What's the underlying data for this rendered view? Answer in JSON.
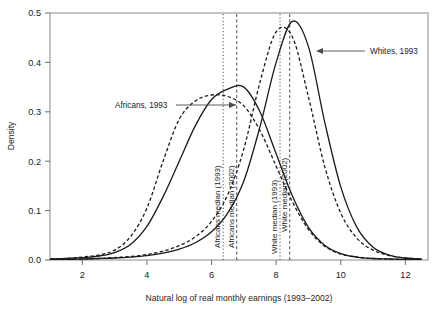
{
  "chart_data": {
    "type": "line",
    "title": "",
    "xlabel": "Natural log of real monthly earnings (1993–2002)",
    "ylabel": "Density",
    "xlim": [
      1.0,
      12.7
    ],
    "ylim": [
      0.0,
      0.5
    ],
    "xticks": [
      2,
      4,
      6,
      8,
      10,
      12
    ],
    "xticklabels": [
      "2",
      "4",
      "6",
      "8",
      "10",
      "12"
    ],
    "yticks": [
      0.0,
      0.1,
      0.2,
      0.3,
      0.4,
      0.5
    ],
    "yticklabels": [
      "0.0",
      "0.1",
      "0.2",
      "0.3",
      "0.4",
      "0.5"
    ],
    "grid": false,
    "legend_position": "none",
    "x": [
      1.0,
      1.5,
      2.0,
      2.5,
      3.0,
      3.5,
      4.0,
      4.5,
      5.0,
      5.5,
      6.0,
      6.5,
      7.0,
      7.5,
      8.0,
      8.5,
      9.0,
      9.5,
      10.0,
      10.5,
      11.0,
      11.5,
      12.0,
      12.5
    ],
    "series": [
      {
        "name": "Africans, 1993",
        "style": "solid",
        "color": "#1a1a1a",
        "values": [
          0.002,
          0.003,
          0.005,
          0.008,
          0.015,
          0.032,
          0.068,
          0.128,
          0.2,
          0.272,
          0.325,
          0.346,
          0.35,
          0.3,
          0.215,
          0.13,
          0.066,
          0.03,
          0.013,
          0.006,
          0.003,
          0.002,
          0.001,
          0.001
        ]
      },
      {
        "name": "Africans, 2002",
        "style": "dashed",
        "color": "#1a1a1a",
        "values": [
          0.002,
          0.003,
          0.006,
          0.01,
          0.02,
          0.048,
          0.105,
          0.2,
          0.285,
          0.322,
          0.334,
          0.331,
          0.312,
          0.262,
          0.19,
          0.118,
          0.062,
          0.028,
          0.012,
          0.006,
          0.003,
          0.002,
          0.001,
          0.001
        ]
      },
      {
        "name": "Whites, 1993",
        "style": "solid",
        "color": "#1a1a1a",
        "values": [
          0.001,
          0.001,
          0.002,
          0.003,
          0.004,
          0.006,
          0.009,
          0.014,
          0.022,
          0.035,
          0.057,
          0.095,
          0.16,
          0.27,
          0.4,
          0.483,
          0.432,
          0.28,
          0.148,
          0.066,
          0.026,
          0.01,
          0.004,
          0.002
        ]
      },
      {
        "name": "Whites, 2002",
        "style": "dashed",
        "color": "#1a1a1a",
        "values": [
          0.001,
          0.001,
          0.002,
          0.003,
          0.005,
          0.007,
          0.011,
          0.018,
          0.029,
          0.047,
          0.078,
          0.132,
          0.225,
          0.36,
          0.462,
          0.452,
          0.33,
          0.19,
          0.095,
          0.044,
          0.02,
          0.009,
          0.004,
          0.002
        ]
      }
    ],
    "vlines": [
      {
        "id": "africans-median-1993",
        "label": "Africans median (1993)",
        "x": 6.36,
        "style": "dotted"
      },
      {
        "id": "africans-median-2002",
        "label": "Africans median (2002)",
        "x": 6.78,
        "style": "dashed"
      },
      {
        "id": "white-median-1993",
        "label": "White median (1993)",
        "x": 8.12,
        "style": "dotted"
      },
      {
        "id": "white-median-2002",
        "label": "White median (2002)",
        "x": 8.42,
        "style": "dashed"
      }
    ],
    "annotations": [
      {
        "id": "africans-1993-callout",
        "text": "Africans, 1993",
        "arrow": "right"
      },
      {
        "id": "whites-1993-callout",
        "text": "Whites, 1993",
        "arrow": "left"
      }
    ]
  }
}
